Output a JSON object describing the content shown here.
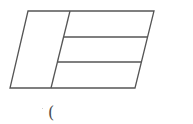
{
  "diagram": {
    "type": "geometry",
    "stroke_color": "#555555",
    "background_color": "#ffffff",
    "parallelogram": {
      "top_left": [
        28,
        11
      ],
      "top_right": [
        154,
        11
      ],
      "bottom_right": [
        135,
        88
      ],
      "bottom_left": [
        10,
        88
      ]
    },
    "slanted_divider": {
      "top": [
        70,
        11
      ],
      "bottom": [
        51,
        88
      ]
    },
    "horizontal_dividers": [
      {
        "y": 37,
        "x_start": 64,
        "x_end": 148
      },
      {
        "y": 62,
        "x_start": 58,
        "x_end": 141
      }
    ],
    "regions": [
      {
        "name": "left-region"
      },
      {
        "name": "right-top-strip"
      },
      {
        "name": "right-middle-strip"
      },
      {
        "name": "right-bottom-strip"
      }
    ]
  },
  "caption": {
    "text": "(",
    "position": [
      48,
      105
    ]
  }
}
